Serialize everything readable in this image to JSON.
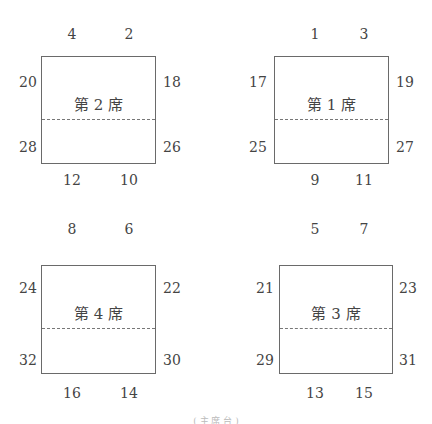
{
  "tables": [
    {
      "id": "table-2",
      "label": "第 2 席",
      "seats": {
        "top_left": "4",
        "top_right": "2",
        "left_upper": "20",
        "right_upper": "18",
        "left_lower": "28",
        "right_lower": "26",
        "bottom_left": "12",
        "bottom_right": "10"
      }
    },
    {
      "id": "table-1",
      "label": "第 1 席",
      "seats": {
        "top_left": "1",
        "top_right": "3",
        "left_upper": "17",
        "right_upper": "19",
        "left_lower": "25",
        "right_lower": "27",
        "bottom_left": "9",
        "bottom_right": "11"
      }
    },
    {
      "id": "table-4",
      "label": "第 4 席",
      "seats": {
        "top_left": "8",
        "top_right": "6",
        "left_upper": "24",
        "right_upper": "22",
        "left_lower": "32",
        "right_lower": "30",
        "bottom_left": "16",
        "bottom_right": "14"
      }
    },
    {
      "id": "table-3",
      "label": "第 3 席",
      "seats": {
        "top_left": "5",
        "top_right": "7",
        "left_upper": "21",
        "right_upper": "23",
        "left_lower": "29",
        "right_lower": "31",
        "bottom_left": "13",
        "bottom_right": "15"
      }
    }
  ],
  "caption": "( 主 席 台 )",
  "colors": {
    "border": "#6a6a6a",
    "text": "#444444",
    "divider": "#777777"
  }
}
